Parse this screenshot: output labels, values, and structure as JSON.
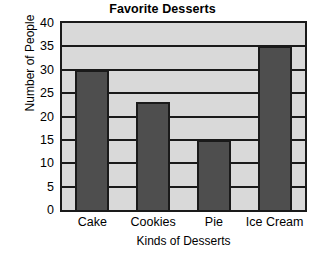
{
  "chart_data": {
    "type": "bar",
    "title": "Favorite Desserts",
    "xlabel": "Kinds of Desserts",
    "ylabel": "Number of People",
    "categories": [
      "Cake",
      "Cookies",
      "Pie",
      "Ice Cream"
    ],
    "values": [
      30,
      23,
      15,
      35
    ],
    "ylim": [
      0,
      40
    ],
    "ytick_labels": [
      "0",
      "5",
      "10",
      "15",
      "20",
      "25",
      "30",
      "35",
      "40"
    ],
    "ytick_values": [
      0,
      5,
      10,
      15,
      20,
      25,
      30,
      35,
      40
    ],
    "grid": true,
    "grid_axis": "y",
    "legend": false,
    "legend_position": "none",
    "colors": {
      "bar_fill": "#4e4e4e",
      "plot_background": "#d9d9d9",
      "axis_line": "#1a1a1a",
      "figure_background": "#ffffff",
      "text": "#000000"
    }
  }
}
